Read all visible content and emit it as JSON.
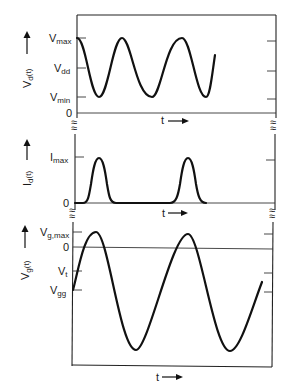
{
  "figure": {
    "panels": [
      {
        "id": "drain-voltage",
        "ylabel": "V",
        "ylabel_sub": "d",
        "ylabel_suffix": "(t)",
        "ticks": [
          {
            "label": "V",
            "sub": "max"
          },
          {
            "label": "V",
            "sub": "dd"
          },
          {
            "label": "V",
            "sub": "min"
          },
          {
            "label": "0",
            "sub": ""
          }
        ],
        "xlabel": "t"
      },
      {
        "id": "drain-current",
        "ylabel": "I",
        "ylabel_sub": "d",
        "ylabel_suffix": "(t)",
        "ticks": [
          {
            "label": "I",
            "sub": "max"
          },
          {
            "label": "0",
            "sub": ""
          }
        ],
        "xlabel": "t"
      },
      {
        "id": "gate-voltage",
        "ylabel": "V",
        "ylabel_sub": "g",
        "ylabel_suffix": "(t)",
        "ticks": [
          {
            "label": "V",
            "sub": "g,max"
          },
          {
            "label": "0",
            "sub": ""
          },
          {
            "label": "V",
            "sub": "t"
          },
          {
            "label": "V",
            "sub": "gg"
          }
        ],
        "xlabel": "t"
      }
    ],
    "axis_break_symbol": "≈",
    "arrow_symbol": "→"
  }
}
